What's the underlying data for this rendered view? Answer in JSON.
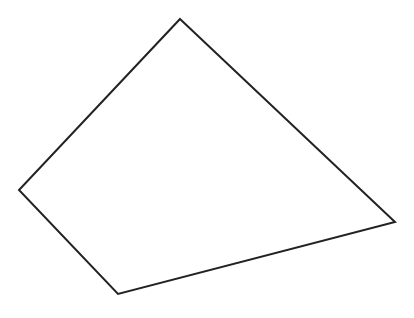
{
  "diagram": {
    "shape": "quadrilateral",
    "stroke_color": "#222222",
    "fill_color": "#ffffff",
    "stroke_width": 2,
    "vertices": [
      {
        "name": "top",
        "x": 180,
        "y": 19
      },
      {
        "name": "right",
        "x": 395,
        "y": 222
      },
      {
        "name": "bottom",
        "x": 118,
        "y": 294
      },
      {
        "name": "left",
        "x": 19,
        "y": 190
      }
    ]
  }
}
